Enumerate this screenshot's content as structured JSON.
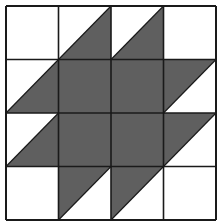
{
  "diagram": {
    "type": "quilt-block",
    "grid": {
      "rows": 4,
      "cols": 4
    },
    "bounds": {
      "x0": 6,
      "y0": 6,
      "x1": 216,
      "y1": 220
    },
    "colors": {
      "dark": "#5f5f5f",
      "light": "#ffffff",
      "line": "#1a1a1a"
    },
    "cells": [
      [
        "white",
        "half-br",
        "half-br",
        "white"
      ],
      [
        "half-br",
        "dark",
        "dark",
        "half-tl"
      ],
      [
        "half-br",
        "dark",
        "dark",
        "half-tl"
      ],
      [
        "white",
        "half-tl",
        "half-tl",
        "white"
      ]
    ],
    "legend": {
      "white": "unshaded square",
      "dark": "fully shaded square",
      "half-br": "square split by diagonal (bottom-left to top-right), lower-right half shaded",
      "half-tl": "square split by diagonal (bottom-left to top-right), upper-left half shaded"
    }
  }
}
